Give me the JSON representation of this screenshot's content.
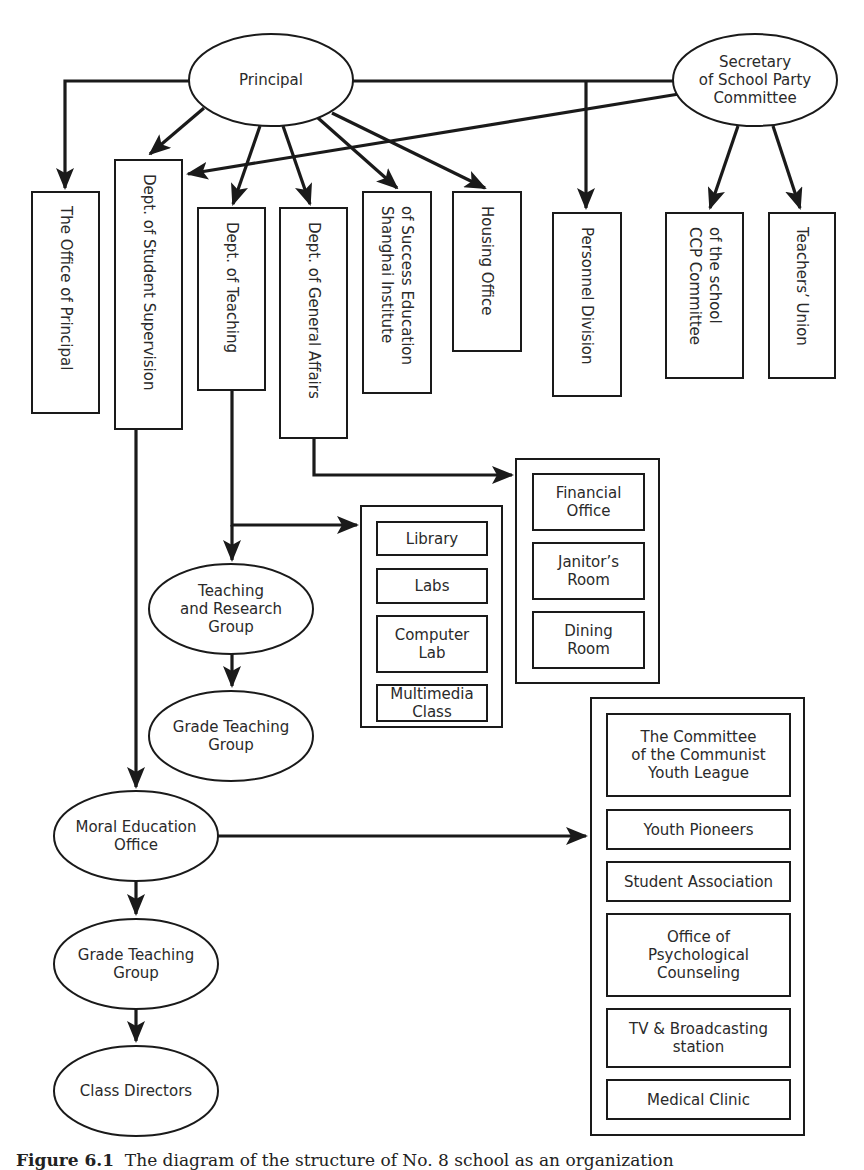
{
  "diagram": {
    "type": "org-chart",
    "top_nodes": {
      "principal": "Principal",
      "secretary": [
        "Secretary",
        "of School Party",
        "Committee"
      ]
    },
    "departments": {
      "office_of_principal": [
        "The Office of Principal"
      ],
      "student_supervision": [
        "Dept. of Student Supervision"
      ],
      "teaching": [
        "Dept. of Teaching"
      ],
      "general_affairs": [
        "Dept. of General Affairs"
      ],
      "shanghai_institute": [
        "Shanghai Institute",
        "of Success Education"
      ],
      "housing_office": [
        "Housing Office"
      ],
      "personnel_division": [
        "Personnel Division"
      ],
      "ccp_committee": [
        "CCP Committee",
        "of the school"
      ],
      "teachers_union": [
        "Teachers’ Union"
      ]
    },
    "general_affairs_units": [
      [
        "Financial",
        "Office"
      ],
      [
        "Janitor’s",
        "Room"
      ],
      [
        "Dining",
        "Room"
      ]
    ],
    "teaching_units": [
      [
        "Library"
      ],
      [
        "Labs"
      ],
      [
        "Computer",
        "Lab"
      ],
      [
        "Multimedia",
        "Class"
      ]
    ],
    "teaching_groups": {
      "teaching_research": [
        "Teaching",
        "and Research",
        "Group"
      ],
      "grade_teaching": [
        "Grade Teaching",
        "Group"
      ]
    },
    "moral_chain": {
      "moral_education": [
        "Moral Education",
        "Office"
      ],
      "grade_teaching": [
        "Grade Teaching",
        "Group"
      ],
      "class_directors": [
        "Class Directors"
      ]
    },
    "moral_units": [
      [
        "The Committee",
        "of the Communist",
        "Youth League"
      ],
      [
        "Youth Pioneers"
      ],
      [
        "Student Association"
      ],
      [
        "Office of",
        "Psychological",
        "Counseling"
      ],
      [
        "TV & Broadcasting",
        "station"
      ],
      [
        "Medical Clinic"
      ]
    ],
    "edges": [
      [
        "Principal",
        "The Office of Principal"
      ],
      [
        "Principal",
        "Dept. of Student Supervision"
      ],
      [
        "Principal",
        "Dept. of Teaching"
      ],
      [
        "Principal",
        "Dept. of General Affairs"
      ],
      [
        "Principal",
        "Shanghai Institute of Success Education"
      ],
      [
        "Principal",
        "Housing Office"
      ],
      [
        "Principal",
        "Personnel Division"
      ],
      [
        "Secretary of School Party Committee",
        "Personnel Division"
      ],
      [
        "Secretary of School Party Committee",
        "Dept. of Student Supervision"
      ],
      [
        "Secretary of School Party Committee",
        "CCP Committee of the school"
      ],
      [
        "Secretary of School Party Committee",
        "Teachers’ Union"
      ],
      [
        "Dept. of General Affairs",
        "General affairs units"
      ],
      [
        "Dept. of Teaching",
        "Teaching units"
      ],
      [
        "Dept. of Teaching",
        "Teaching and Research Group"
      ],
      [
        "Teaching and Research Group",
        "Grade Teaching Group"
      ],
      [
        "Dept. of Student Supervision",
        "Moral Education Office"
      ],
      [
        "Moral Education Office",
        "Moral education units"
      ],
      [
        "Moral Education Office",
        "Grade Teaching Group"
      ],
      [
        "Grade Teaching Group",
        "Class Directors"
      ]
    ]
  },
  "caption": {
    "label": "Figure 6.1",
    "text": "The diagram of the structure of No. 8 school as an organization"
  }
}
